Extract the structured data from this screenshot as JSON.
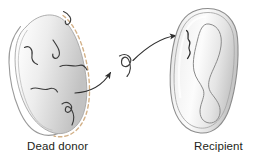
{
  "figure": {
    "labels": {
      "donor": "Dead donor",
      "recipient": "Recipient"
    },
    "colors": {
      "background": "#ffffff",
      "cell_outline": "#8c8c8c",
      "cell_fill_light": "#fdfdfd",
      "cell_fill_mid": "#e8e8e8",
      "cell_fill_dark": "#c9c9c9",
      "dna_fragment": "#3b3b3b",
      "chromosome": "#8a8a8a",
      "arrow": "#2f2f2f",
      "dashed_membrane": "#d8b98a",
      "label_text": "#231f20"
    },
    "elements": {
      "donor_cell": "dead-donor-bacterium",
      "donor_membrane_style": "dashed",
      "donor_dna_pieces": 6,
      "free_dna_fragment": "released-dna-fragment",
      "recipient_cell": "recipient-bacterium",
      "recipient_membrane_style": "solid-double",
      "recipient_chromosome": "circular-chromosome-loop",
      "incoming_dna": "taken-up-dna-fragment",
      "arrows": 2
    }
  }
}
